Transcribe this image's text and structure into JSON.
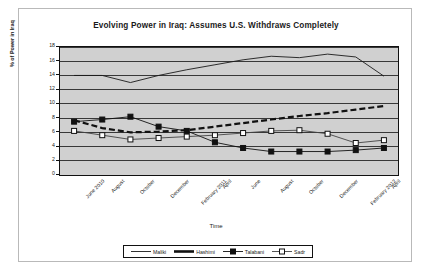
{
  "chart_data": {
    "type": "line",
    "title": "Evolving Power in Iraq: Assumes U.S. Withdraws Completely",
    "xlabel": "Time",
    "ylabel": "% of Power in Iraq",
    "ylim": [
      0,
      18
    ],
    "ytick_step": 2,
    "yticks": [
      "18",
      "16",
      "14",
      "12",
      "10",
      "8",
      "6",
      "4",
      "2",
      "0"
    ],
    "grid": true,
    "grid_axis": "y",
    "legend_position": "bottom",
    "plot_background": "#d0d0d0",
    "categories": [
      "June 2010",
      "August",
      "October",
      "December",
      "February 2011",
      "April",
      "June",
      "August",
      "October",
      "December",
      "February 2012",
      "April"
    ],
    "series": [
      {
        "name": "Maliki",
        "style": "thin-solid-line",
        "marker": "none",
        "color": "#1a1a1a",
        "values": [
          14.0,
          14.0,
          13.0,
          14.0,
          14.8,
          15.5,
          16.2,
          16.7,
          16.5,
          17.0,
          16.6,
          13.9
        ]
      },
      {
        "name": "Hashimi",
        "style": "thick-dashed-line",
        "marker": "none",
        "color": "#111111",
        "values": [
          7.7,
          6.6,
          6.0,
          6.1,
          6.3,
          6.8,
          7.3,
          7.8,
          8.3,
          8.7,
          9.2,
          9.7
        ]
      },
      {
        "name": "Talabani",
        "style": "solid-line",
        "marker": "filled-square",
        "color": "#111111",
        "values": [
          7.5,
          7.8,
          8.2,
          6.8,
          6.2,
          4.6,
          3.8,
          3.3,
          3.3,
          3.3,
          3.5,
          3.8
        ]
      },
      {
        "name": "Sadr",
        "style": "solid-line",
        "marker": "open-square",
        "color": "#444444",
        "values": [
          6.2,
          5.6,
          5.0,
          5.2,
          5.4,
          5.6,
          5.9,
          6.2,
          6.3,
          5.8,
          4.5,
          4.9
        ]
      }
    ]
  }
}
